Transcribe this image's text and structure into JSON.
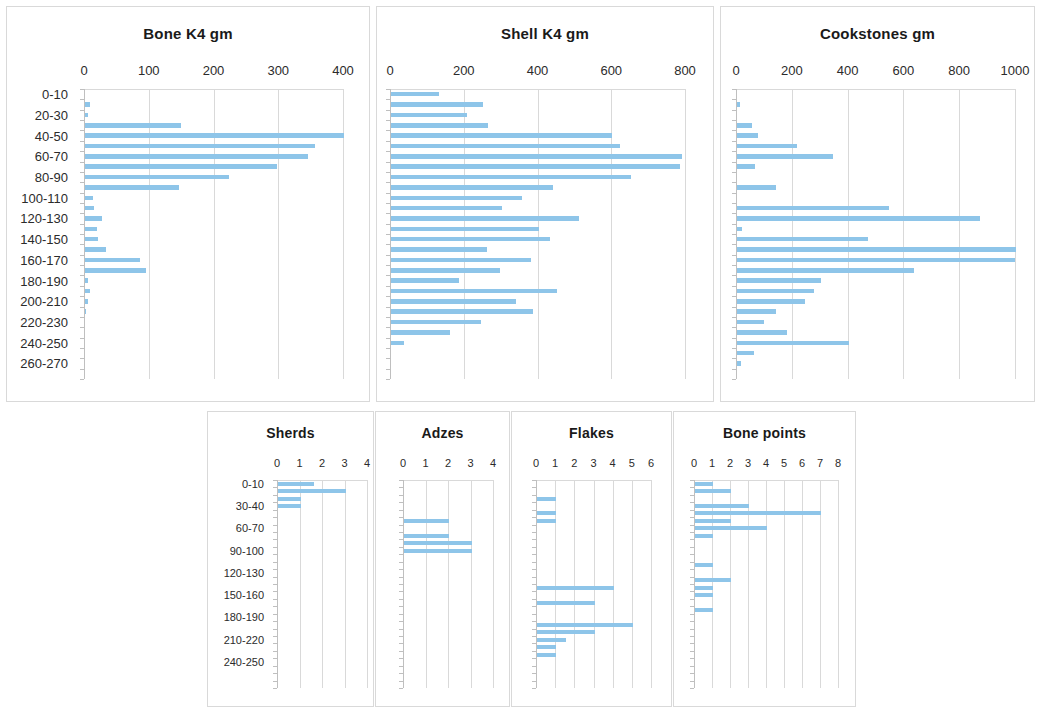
{
  "page": {
    "background": "#ffffff",
    "bar_color": "#8ec5e9",
    "grid_color": "#d9d9d9"
  },
  "depth_labels_main": [
    "0-10",
    "20-30",
    "40-50",
    "60-70",
    "80-90",
    "100-110",
    "120-130",
    "140-150",
    "160-170",
    "180-190",
    "200-210",
    "220-230",
    "240-250",
    "260-270"
  ],
  "depth_labels_small": [
    "0-10",
    "30-40",
    "60-70",
    "90-100",
    "120-130",
    "150-160",
    "180-190",
    "210-220",
    "240-250"
  ],
  "chart_data": [
    {
      "type": "bar",
      "orientation": "horizontal",
      "title": "Bone K4 gm",
      "xlabel": "",
      "ylabel": "",
      "xlim": [
        0,
        400
      ],
      "xticks": [
        0,
        100,
        200,
        300,
        400
      ],
      "ytick_labels": [
        "0-10",
        "20-30",
        "40-50",
        "60-70",
        "80-90",
        "100-110",
        "120-130",
        "140-150",
        "160-170",
        "180-190",
        "200-210",
        "220-230",
        "240-250",
        "260-270"
      ],
      "ytick_every": 2,
      "categories": [
        "0-10",
        "10-20",
        "20-30",
        "30-40",
        "40-50",
        "50-60",
        "60-70",
        "70-80",
        "80-90",
        "90-100",
        "100-110",
        "110-120",
        "120-130",
        "130-140",
        "140-150",
        "150-160",
        "160-170",
        "170-180",
        "180-190",
        "190-200",
        "200-210",
        "210-220",
        "220-230",
        "230-240",
        "240-250",
        "250-260",
        "260-270",
        "270-280"
      ],
      "values": [
        0,
        7,
        4,
        148,
        400,
        355,
        345,
        296,
        223,
        145,
        12,
        14,
        26,
        18,
        20,
        33,
        85,
        94,
        4,
        8,
        5,
        1,
        0,
        0,
        0,
        0,
        0,
        0
      ],
      "grid": true
    },
    {
      "type": "bar",
      "orientation": "horizontal",
      "title": "Shell K4 gm",
      "xlabel": "",
      "ylabel": "",
      "xlim": [
        0,
        800
      ],
      "xticks": [
        0,
        200,
        400,
        600,
        800
      ],
      "ytick_labels": [],
      "categories": [
        "0-10",
        "10-20",
        "20-30",
        "30-40",
        "40-50",
        "50-60",
        "60-70",
        "70-80",
        "80-90",
        "90-100",
        "100-110",
        "110-120",
        "120-130",
        "130-140",
        "140-150",
        "150-160",
        "160-170",
        "170-180",
        "180-190",
        "190-200",
        "200-210",
        "210-220",
        "220-230",
        "230-240",
        "240-250",
        "250-260",
        "260-270",
        "270-280"
      ],
      "values": [
        130,
        250,
        205,
        262,
        600,
        620,
        790,
        785,
        650,
        440,
        355,
        300,
        510,
        400,
        430,
        260,
        380,
        295,
        185,
        450,
        340,
        385,
        245,
        160,
        35,
        0,
        0,
        0
      ],
      "grid": true
    },
    {
      "type": "bar",
      "orientation": "horizontal",
      "title": "Cookstones gm",
      "xlabel": "",
      "ylabel": "",
      "xlim": [
        0,
        1000
      ],
      "xticks": [
        0,
        200,
        400,
        600,
        800,
        1000
      ],
      "ytick_labels": [],
      "categories": [
        "0-10",
        "10-20",
        "20-30",
        "30-40",
        "40-50",
        "50-60",
        "60-70",
        "70-80",
        "80-90",
        "90-100",
        "100-110",
        "110-120",
        "120-130",
        "130-140",
        "140-150",
        "150-160",
        "160-170",
        "170-180",
        "180-190",
        "190-200",
        "200-210",
        "210-220",
        "220-230",
        "230-240",
        "240-250",
        "250-260",
        "260-270",
        "270-280"
      ],
      "values": [
        0,
        10,
        0,
        55,
        75,
        215,
        345,
        65,
        0,
        140,
        0,
        545,
        870,
        18,
        470,
        1000,
        995,
        635,
        300,
        275,
        245,
        140,
        95,
        180,
        400,
        60,
        15,
        0
      ],
      "grid": true
    },
    {
      "type": "bar",
      "orientation": "horizontal",
      "title": "Sherds",
      "xlabel": "",
      "ylabel": "",
      "xlim": [
        0,
        4
      ],
      "xticks": [
        0,
        1,
        2,
        3,
        4
      ],
      "ytick_labels": [
        "0-10",
        "30-40",
        "60-70",
        "90-100",
        "120-130",
        "150-160",
        "180-190",
        "210-220",
        "240-250"
      ],
      "ytick_every": 3,
      "categories": [
        "0-10",
        "10-20",
        "20-30",
        "30-40",
        "40-50",
        "50-60",
        "60-70",
        "70-80",
        "80-90",
        "90-100",
        "100-110",
        "110-120",
        "120-130",
        "130-140",
        "140-150",
        "150-160",
        "160-170",
        "170-180",
        "180-190",
        "190-200",
        "200-210",
        "210-220",
        "220-230",
        "230-240",
        "240-250",
        "250-260",
        "260-270",
        "270-280"
      ],
      "values": [
        1.6,
        3,
        1,
        1,
        0,
        0,
        0,
        0,
        0,
        0,
        0,
        0,
        0,
        0,
        0,
        0,
        0,
        0,
        0,
        0,
        0,
        0,
        0,
        0,
        0,
        0,
        0,
        0
      ],
      "grid": true
    },
    {
      "type": "bar",
      "orientation": "horizontal",
      "title": "Adzes",
      "xlabel": "",
      "ylabel": "",
      "xlim": [
        0,
        4
      ],
      "xticks": [
        0,
        1,
        2,
        3,
        4
      ],
      "ytick_labels": [],
      "categories": [
        "0-10",
        "10-20",
        "20-30",
        "30-40",
        "40-50",
        "50-60",
        "60-70",
        "70-80",
        "80-90",
        "90-100",
        "100-110",
        "110-120",
        "120-130",
        "130-140",
        "140-150",
        "150-160",
        "160-170",
        "170-180",
        "180-190",
        "190-200",
        "200-210",
        "210-220",
        "220-230",
        "230-240",
        "240-250",
        "250-260",
        "260-270",
        "270-280"
      ],
      "values": [
        0,
        0,
        0,
        0,
        0,
        2,
        0,
        2,
        3,
        3,
        0,
        0,
        0,
        0,
        0,
        0,
        0,
        0,
        0,
        0,
        0,
        0,
        0,
        0,
        0,
        0,
        0,
        0
      ],
      "grid": true
    },
    {
      "type": "bar",
      "orientation": "horizontal",
      "title": "Flakes",
      "xlabel": "",
      "ylabel": "",
      "xlim": [
        0,
        6
      ],
      "xticks": [
        0,
        1,
        2,
        3,
        4,
        5,
        6
      ],
      "ytick_labels": [],
      "categories": [
        "0-10",
        "10-20",
        "20-30",
        "30-40",
        "40-50",
        "50-60",
        "60-70",
        "70-80",
        "80-90",
        "90-100",
        "100-110",
        "110-120",
        "120-130",
        "130-140",
        "140-150",
        "150-160",
        "160-170",
        "170-180",
        "180-190",
        "190-200",
        "200-210",
        "210-220",
        "220-230",
        "230-240",
        "240-250",
        "250-260",
        "260-270",
        "270-280"
      ],
      "values": [
        0,
        0,
        1,
        0,
        1,
        1,
        0,
        0,
        0,
        0,
        0,
        0,
        0,
        0,
        4,
        0,
        3,
        0,
        0,
        5,
        3,
        1.5,
        1,
        1,
        0,
        0,
        0,
        0
      ],
      "grid": true
    },
    {
      "type": "bar",
      "orientation": "horizontal",
      "title": "Bone points",
      "xlabel": "",
      "ylabel": "",
      "xlim": [
        0,
        8
      ],
      "xticks": [
        0,
        1,
        2,
        3,
        4,
        5,
        6,
        7,
        8
      ],
      "ytick_labels": [],
      "categories": [
        "0-10",
        "10-20",
        "20-30",
        "30-40",
        "40-50",
        "50-60",
        "60-70",
        "70-80",
        "80-90",
        "90-100",
        "100-110",
        "110-120",
        "120-130",
        "130-140",
        "140-150",
        "150-160",
        "160-170",
        "170-180",
        "180-190",
        "190-200",
        "200-210",
        "210-220",
        "220-230",
        "230-240",
        "240-250",
        "250-260",
        "260-270",
        "270-280"
      ],
      "values": [
        1,
        2,
        0,
        3,
        7,
        2,
        4,
        1,
        0,
        0,
        0,
        1,
        0,
        2,
        1,
        1,
        0,
        1,
        0,
        0,
        0,
        0,
        0,
        0,
        0,
        0,
        0,
        0
      ],
      "grid": true
    }
  ],
  "panels": [
    {
      "id": "bone-k4",
      "title": "Bone K4 gm",
      "chart_index": 0
    },
    {
      "id": "shell-k4",
      "title": "Shell K4 gm",
      "chart_index": 1
    },
    {
      "id": "cookstones",
      "title": "Cookstones gm",
      "chart_index": 2
    },
    {
      "id": "sherds",
      "title": "Sherds",
      "chart_index": 3
    },
    {
      "id": "adzes",
      "title": "Adzes",
      "chart_index": 4
    },
    {
      "id": "flakes",
      "title": "Flakes",
      "chart_index": 5
    },
    {
      "id": "bone-points",
      "title": "Bone points",
      "chart_index": 6
    }
  ]
}
